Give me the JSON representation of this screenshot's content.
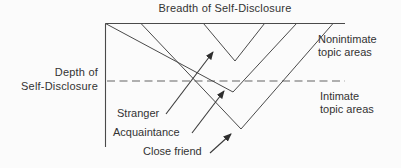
{
  "diagram": {
    "title": "Breadth of Self-Disclosure",
    "depth_axis": {
      "line1": "Depth of",
      "line2": "Self-Disclosure"
    },
    "regions": {
      "nonintimate": {
        "line1": "Nonintimate",
        "line2": "topic areas"
      },
      "intimate": {
        "line1": "Intimate",
        "line2": "topic areas"
      }
    },
    "levels": [
      {
        "label": "Stranger"
      },
      {
        "label": "Acquaintance"
      },
      {
        "label": "Close friend"
      }
    ],
    "icons": {
      "arrows": "solid-black-pointer-arrowheads"
    },
    "colors": {
      "solid_line": "#4a4a4a",
      "dashed_line": "#979797",
      "text": "#333333",
      "background": "#fbfbfb"
    }
  }
}
